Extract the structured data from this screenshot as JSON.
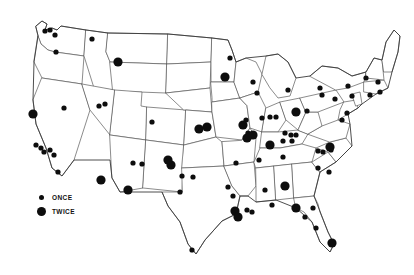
{
  "figure": {
    "type": "dot-density-map",
    "region": "United States",
    "background_color": "#ffffff",
    "dot_color": "#0d0d0d",
    "border_color": "#5a5a5a"
  },
  "legend": {
    "name": "visit-frequency-legend",
    "items": [
      {
        "key": "once",
        "label": "ONCE",
        "marker": "small-dot",
        "radius_px": 2.6
      },
      {
        "key": "twice",
        "label": "TWICE",
        "marker": "large-dot",
        "radius_px": 4.6
      }
    ]
  },
  "chart_data": {
    "type": "scatter",
    "title": "",
    "xlabel": "",
    "ylabel": "",
    "projection": "us-albers-like",
    "xlim": [
      0,
      414
    ],
    "ylim": [
      0,
      275
    ],
    "grid": false,
    "legend_position": "bottom-left",
    "series": [
      {
        "name": "ONCE",
        "marker_radius": 2.6,
        "color": "#0d0d0d",
        "values": [
          [
            45,
            31
          ],
          [
            50,
            30
          ],
          [
            55,
            35
          ],
          [
            56,
            52
          ],
          [
            92,
            39
          ],
          [
            64,
            108
          ],
          [
            36,
            145
          ],
          [
            41,
            148
          ],
          [
            44,
            152
          ],
          [
            50,
            150
          ],
          [
            54,
            155
          ],
          [
            58,
            172
          ],
          [
            99,
            106
          ],
          [
            105,
            104
          ],
          [
            152,
            122
          ],
          [
            133,
            163
          ],
          [
            193,
            177
          ],
          [
            180,
            192
          ],
          [
            230,
            58
          ],
          [
            253,
            82
          ],
          [
            257,
            93
          ],
          [
            288,
            90
          ],
          [
            262,
            118
          ],
          [
            270,
            117
          ],
          [
            246,
            120
          ],
          [
            248,
            133
          ],
          [
            276,
            117
          ],
          [
            285,
            133
          ],
          [
            291,
            135
          ],
          [
            283,
            141
          ],
          [
            292,
            141
          ],
          [
            296,
            135
          ],
          [
            259,
            160
          ],
          [
            283,
            157
          ],
          [
            265,
            190
          ],
          [
            307,
            111
          ],
          [
            320,
            88
          ],
          [
            322,
            95
          ],
          [
            335,
            99
          ],
          [
            348,
            86
          ],
          [
            352,
            96
          ],
          [
            366,
            78
          ],
          [
            378,
            82
          ],
          [
            380,
            92
          ],
          [
            370,
            95
          ],
          [
            347,
            113
          ],
          [
            342,
            120
          ],
          [
            318,
            151
          ],
          [
            323,
            152
          ],
          [
            331,
            150
          ],
          [
            318,
            168
          ],
          [
            329,
            172
          ],
          [
            313,
            208
          ],
          [
            316,
            228
          ],
          [
            305,
            217
          ],
          [
            228,
            187
          ],
          [
            233,
            196
          ],
          [
            236,
            163
          ],
          [
            247,
            210
          ],
          [
            252,
            212
          ],
          [
            192,
            250
          ],
          [
            182,
            176
          ],
          [
            272,
            205
          ],
          [
            142,
            164
          ]
        ]
      },
      {
        "name": "TWICE",
        "marker_radius": 4.6,
        "color": "#0d0d0d",
        "values": [
          [
            118,
            62
          ],
          [
            33,
            114
          ],
          [
            101,
            180
          ],
          [
            128,
            190
          ],
          [
            171,
            165
          ],
          [
            225,
            77
          ],
          [
            199,
            129
          ],
          [
            207,
            127
          ],
          [
            243,
            125
          ],
          [
            253,
            135
          ],
          [
            296,
            112
          ],
          [
            270,
            145
          ],
          [
            235,
            211
          ],
          [
            238,
            217
          ],
          [
            285,
            186
          ],
          [
            296,
            208
          ],
          [
            332,
            243
          ],
          [
            330,
            147
          ],
          [
            168,
            160
          ],
          [
            247,
            138
          ]
        ]
      }
    ]
  }
}
